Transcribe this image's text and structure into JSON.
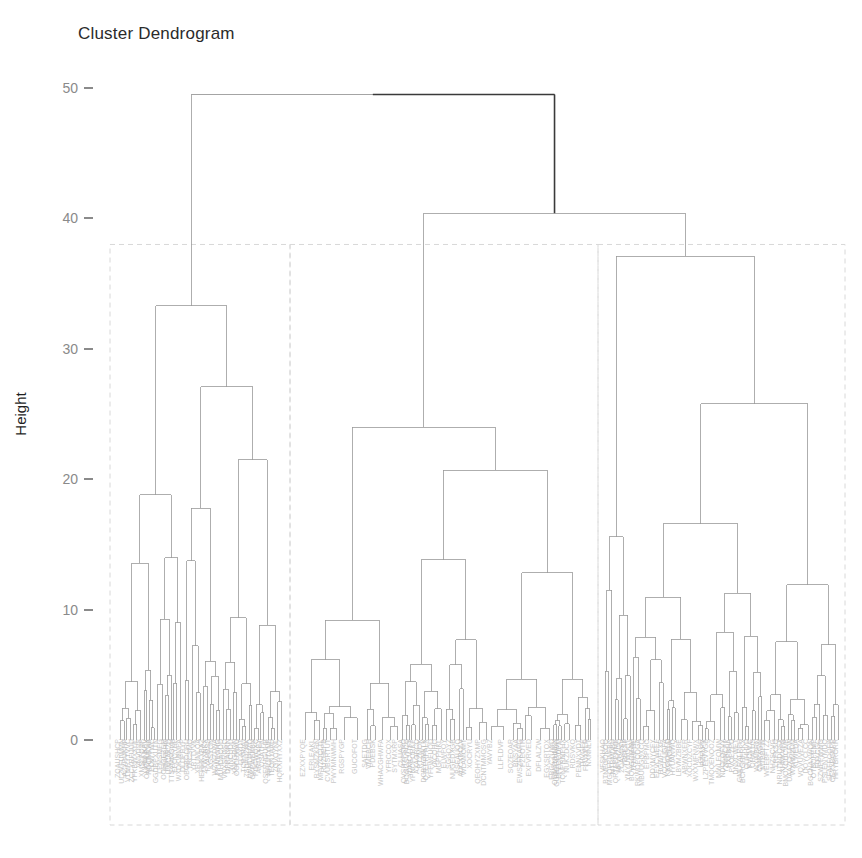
{
  "plot": {
    "title": "Cluster Dendrogram",
    "y_axis_label": "Height",
    "background_color": "#ffffff",
    "branch_color": "#9a9a9a",
    "root_branch_color": "#3a3a3a",
    "cluster_box_color": "#d8d8d8",
    "leaf_label_color": "#b7b7b7",
    "tick_color": "#8a8a8a"
  },
  "axis": {
    "tick_labels": [
      "0",
      "10",
      "20",
      "30",
      "40",
      "50"
    ],
    "tick_values": [
      0,
      10,
      20,
      30,
      40,
      50
    ],
    "range": [
      0,
      52
    ]
  },
  "clusters": {
    "count": 3,
    "boxes": [
      {
        "label": "cluster-1",
        "x_start": 110,
        "x_end": 290,
        "top_height": 38.0
      },
      {
        "label": "cluster-2",
        "x_start": 290,
        "x_end": 598,
        "top_height": 38.0
      },
      {
        "label": "cluster-3",
        "x_start": 598,
        "x_end": 845,
        "top_height": 38.0
      }
    ]
  },
  "chart_data": {
    "type": "dendrogram",
    "title": "Cluster Dendrogram",
    "xlabel": "",
    "ylabel": "Height",
    "ylim": [
      0,
      52
    ],
    "yticks": [
      0,
      10,
      20,
      30,
      40,
      50
    ],
    "grid": false,
    "legend": false,
    "n_leaves": 180,
    "k_clusters": 3,
    "root_height": 49.5,
    "merges": [
      {
        "id": "root",
        "height": 49.5,
        "left_x": 165,
        "right_x": 525,
        "highlighted": true
      },
      {
        "id": "m-right-top",
        "height": 40.4,
        "left_x": 378,
        "right_x": 665
      },
      {
        "id": "c1-root",
        "height": 33.3,
        "left_x": 152,
        "right_x": 207
      },
      {
        "id": "c3-root",
        "height": 37.1,
        "left_x": 601,
        "right_x": 723
      },
      {
        "id": "c1-b",
        "height": 27.1,
        "left_x": 190,
        "right_x": 224
      },
      {
        "id": "c3-b",
        "height": 25.8,
        "left_x": 662,
        "right_x": 784
      },
      {
        "id": "c2-root",
        "height": 24.0,
        "left_x": 311,
        "right_x": 446
      },
      {
        "id": "c2-b",
        "height": 20.7,
        "left_x": 407,
        "right_x": 485
      },
      {
        "id": "c1-c",
        "height": 19.7,
        "left_x": 214,
        "right_x": 234
      },
      {
        "id": "c1-d",
        "height": 18.8,
        "left_x": 139,
        "right_x": 165
      },
      {
        "id": "c1-e",
        "height": 17.7,
        "left_x": 226,
        "right_x": 242
      },
      {
        "id": "c2-c",
        "height": 17.4,
        "left_x": 463,
        "right_x": 508
      },
      {
        "id": "c3-c",
        "height": 16.8,
        "left_x": 744,
        "right_x": 824
      },
      {
        "id": "c3-d",
        "height": 15.6,
        "left_x": 605,
        "right_x": 617
      },
      {
        "id": "c1-f",
        "height": 14.3,
        "left_x": 179,
        "right_x": 201
      },
      {
        "id": "c2-d",
        "height": 14.4,
        "left_x": 371,
        "right_x": 416
      },
      {
        "id": "c3-e",
        "height": 13.0,
        "left_x": 628,
        "right_x": 646
      },
      {
        "id": "c2-e",
        "height": 13.4,
        "left_x": 496,
        "right_x": 531
      },
      {
        "id": "c3-f",
        "height": 12.4,
        "left_x": 651,
        "right_x": 677
      },
      {
        "id": "c1-g",
        "height": 12.1,
        "left_x": 157,
        "right_x": 173
      },
      {
        "id": "c1-h",
        "height": 11.9,
        "left_x": 194,
        "right_x": 209
      },
      {
        "id": "c3-g",
        "height": 11.2,
        "left_x": 684,
        "right_x": 705
      },
      {
        "id": "c2-f",
        "height": 11.5,
        "left_x": 505,
        "right_x": 520
      },
      {
        "id": "c2-g",
        "height": 10.6,
        "left_x": 429,
        "right_x": 447
      },
      {
        "id": "c1-i",
        "height": 10.4,
        "left_x": 236,
        "right_x": 258
      },
      {
        "id": "c3-h",
        "height": 10.3,
        "left_x": 769,
        "right_x": 796
      },
      {
        "id": "c2-h",
        "height": 9.8,
        "left_x": 519,
        "right_x": 541
      }
    ]
  },
  "leaf_labels": {
    "visible": true,
    "readable": false,
    "description": "dense unreadable gray sample-id text rotated along the x-axis baseline"
  }
}
